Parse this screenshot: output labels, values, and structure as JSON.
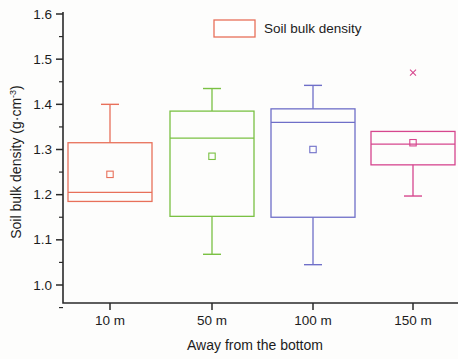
{
  "chart_data": {
    "type": "box",
    "title": "",
    "xlabel": "Away from the bottom",
    "ylabel_main": "Soil bulk density  (g·cm",
    "ylabel_sup": "-3",
    "ylabel_close": ")",
    "ylabel_full": "Soil bulk density (g·cm⁻³)",
    "categories": [
      "10 m",
      "50 m",
      "100 m",
      "150 m"
    ],
    "ylim": [
      0.955,
      1.6
    ],
    "ytick_labels": [
      "1.0",
      "1.1",
      "1.2",
      "1.3",
      "1.4",
      "1.5",
      "1.6"
    ],
    "ytick_values": [
      1.0,
      1.1,
      1.2,
      1.3,
      1.4,
      1.5,
      1.6
    ],
    "yminor_values": [
      1.05,
      1.15,
      1.25,
      1.35,
      1.45,
      1.55
    ],
    "grid": false,
    "legend": {
      "position": "top-center",
      "entries": [
        {
          "label": "Soil bulk density",
          "color": "#e8705a"
        }
      ]
    },
    "series": [
      {
        "name": "Soil bulk density",
        "boxes": [
          {
            "category": "10 m",
            "color": "#e8705a",
            "whisker_high": 1.4,
            "q3": 1.315,
            "median": 1.205,
            "mean": 1.245,
            "q1": 1.185,
            "whisker_low": 1.185,
            "outliers": []
          },
          {
            "category": "50 m",
            "color": "#7ac143",
            "whisker_high": 1.435,
            "q3": 1.385,
            "median": 1.325,
            "mean": 1.285,
            "q1": 1.152,
            "whisker_low": 1.068,
            "outliers": []
          },
          {
            "category": "100 m",
            "color": "#6f6fc8",
            "whisker_high": 1.442,
            "q3": 1.39,
            "median": 1.36,
            "mean": 1.3,
            "q1": 1.15,
            "whisker_low": 1.045,
            "outliers": []
          },
          {
            "category": "150 m",
            "color": "#d6468e",
            "whisker_high": 1.34,
            "q3": 1.34,
            "median": 1.312,
            "mean": 1.315,
            "q1": 1.266,
            "whisker_low": 1.197,
            "outliers": [
              1.47
            ]
          }
        ]
      }
    ]
  },
  "axes": {
    "y_axis_name": "soil-bulk-density-axis",
    "x_axis_name": "distance-axis"
  }
}
